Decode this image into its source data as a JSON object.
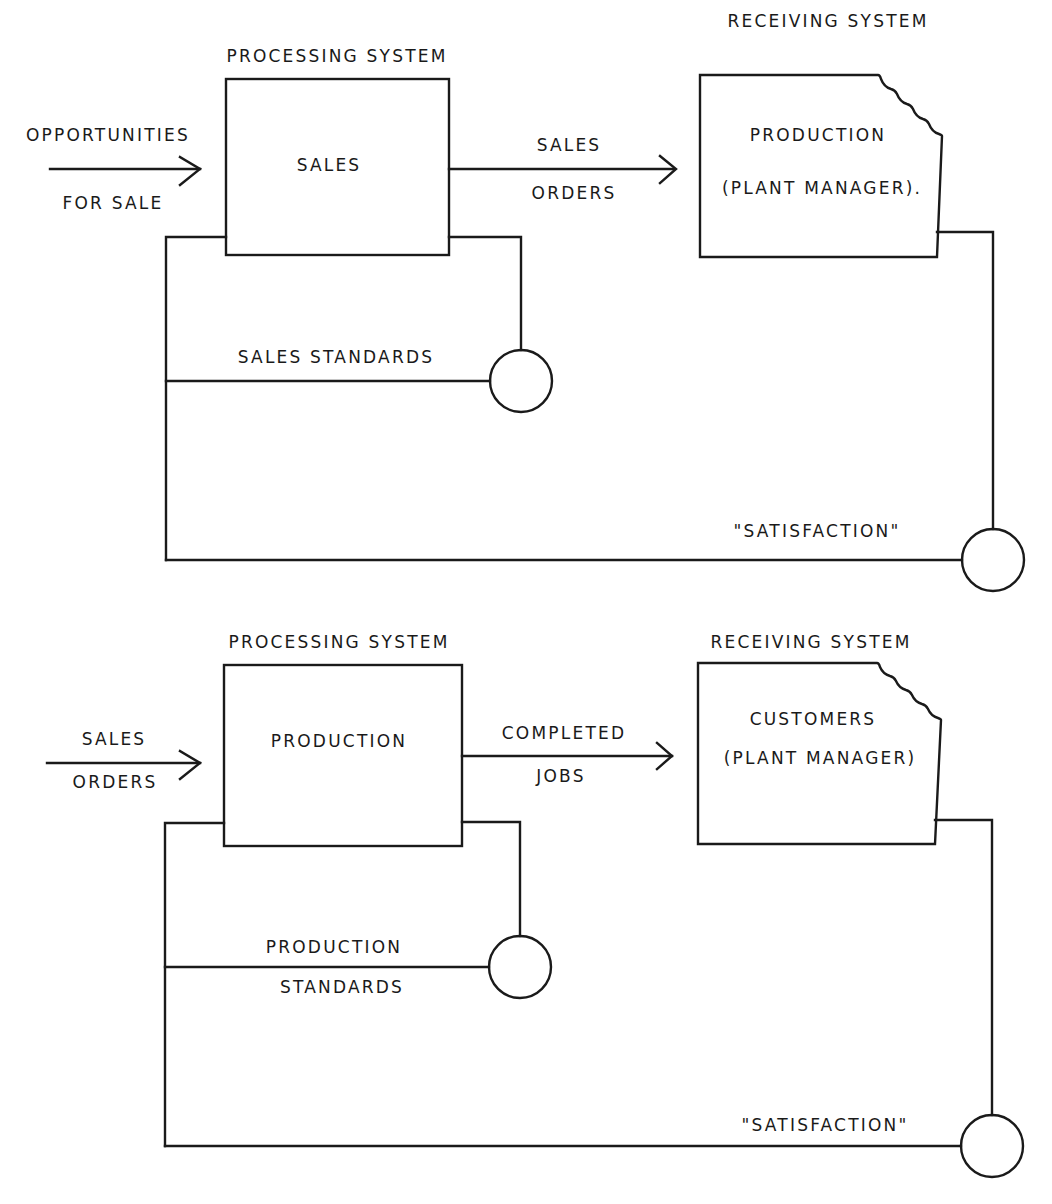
{
  "diagrams": [
    {
      "name": "sales-loop",
      "processing_header": "PROCESSING SYSTEM",
      "receiving_header": "RECEIVING SYSTEM",
      "input_top": "OPPORTUNITIES",
      "input_bottom": "FOR SALE",
      "processing_box": "SALES",
      "output_top": "SALES",
      "output_bottom": "ORDERS",
      "receiving_line1": "PRODUCTION",
      "receiving_line2": "(PLANT MANAGER).",
      "standards_line1": "SALES STANDARDS",
      "standards_line2": "",
      "satisfaction": "\"SATISFACTION\""
    },
    {
      "name": "production-loop",
      "processing_header": "PROCESSING SYSTEM",
      "receiving_header": "RECEIVING SYSTEM",
      "input_top": "SALES",
      "input_bottom": "ORDERS",
      "processing_box": "PRODUCTION",
      "output_top": "COMPLETED",
      "output_bottom": "JOBS",
      "receiving_line1": "CUSTOMERS",
      "receiving_line2": "(PLANT MANAGER)",
      "standards_line1": "PRODUCTION",
      "standards_line2": "STANDARDS",
      "satisfaction": "\"SATISFACTION\""
    }
  ]
}
